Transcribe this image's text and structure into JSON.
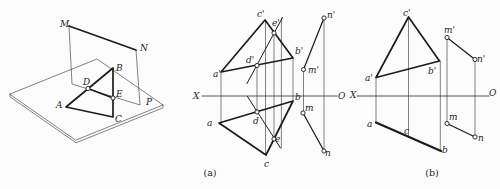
{
  "figure": {
    "ink": "#1c1c1c",
    "bg": "#fcfcfc"
  },
  "captions": {
    "a": "(a)",
    "b": "(b)"
  },
  "pictorial": {
    "labels": [
      {
        "t": "M",
        "x": 60,
        "y": 27
      },
      {
        "t": "N",
        "x": 140,
        "y": 51
      },
      {
        "t": "A",
        "x": 56,
        "y": 108
      },
      {
        "t": "B",
        "x": 116,
        "y": 71
      },
      {
        "t": "C",
        "x": 115,
        "y": 122
      },
      {
        "t": "D",
        "x": 83,
        "y": 85
      },
      {
        "t": "E",
        "x": 116,
        "y": 97
      },
      {
        "t": "P",
        "x": 146,
        "y": 105
      }
    ],
    "markers": [
      {
        "p": "D",
        "x": 88,
        "y": 88.5
      },
      {
        "p": "E",
        "x": 113,
        "y": 98
      }
    ]
  },
  "view_a": {
    "labels": [
      {
        "t": "X",
        "x": 193,
        "y": 99
      },
      {
        "t": "O",
        "x": 338,
        "y": 99
      },
      {
        "t": "a'",
        "x": 213,
        "y": 77
      },
      {
        "t": "c'",
        "x": 257,
        "y": 17
      },
      {
        "t": "b'",
        "x": 295,
        "y": 54
      },
      {
        "t": "d'",
        "x": 246,
        "y": 63
      },
      {
        "t": "e'",
        "x": 272,
        "y": 26
      },
      {
        "t": "m'",
        "x": 308,
        "y": 73
      },
      {
        "t": "n'",
        "x": 327,
        "y": 18
      },
      {
        "t": "a",
        "x": 207,
        "y": 126
      },
      {
        "t": "b",
        "x": 295,
        "y": 100
      },
      {
        "t": "c",
        "x": 264,
        "y": 167
      },
      {
        "t": "d",
        "x": 253,
        "y": 124
      },
      {
        "t": "e",
        "x": 275,
        "y": 142
      },
      {
        "t": "m",
        "x": 305,
        "y": 111
      },
      {
        "t": "n",
        "x": 325,
        "y": 156
      }
    ],
    "markers": [
      {
        "p": "d-front",
        "x": 257,
        "y": 65.5
      },
      {
        "p": "e-front",
        "x": 274,
        "y": 33
      },
      {
        "p": "m-front",
        "x": 303.5,
        "y": 69.5
      },
      {
        "p": "n-front",
        "x": 324,
        "y": 18
      },
      {
        "p": "d-plan",
        "x": 257,
        "y": 112
      },
      {
        "p": "e-plan",
        "x": 274,
        "y": 139
      },
      {
        "p": "m-plan",
        "x": 303,
        "y": 113
      },
      {
        "p": "n-plan",
        "x": 324,
        "y": 151
      }
    ]
  },
  "view_b": {
    "labels": [
      {
        "t": "X",
        "x": 350,
        "y": 98
      },
      {
        "t": "O",
        "x": 489,
        "y": 96
      },
      {
        "t": "a'",
        "x": 365,
        "y": 81
      },
      {
        "t": "c'",
        "x": 403,
        "y": 16
      },
      {
        "t": "b'",
        "x": 428,
        "y": 74
      },
      {
        "t": "m'",
        "x": 444,
        "y": 33
      },
      {
        "t": "n'",
        "x": 477,
        "y": 62
      },
      {
        "t": "a",
        "x": 367,
        "y": 127
      },
      {
        "t": "c",
        "x": 404,
        "y": 134
      },
      {
        "t": "b",
        "x": 442,
        "y": 153
      },
      {
        "t": "m",
        "x": 449,
        "y": 120
      },
      {
        "t": "n",
        "x": 478,
        "y": 141
      }
    ],
    "markers": [
      {
        "p": "m-front",
        "x": 447,
        "y": 37.5
      },
      {
        "p": "n-front",
        "x": 475,
        "y": 59.5
      },
      {
        "p": "m-plan",
        "x": 447,
        "y": 123.5
      },
      {
        "p": "n-plan",
        "x": 475,
        "y": 137
      }
    ]
  }
}
